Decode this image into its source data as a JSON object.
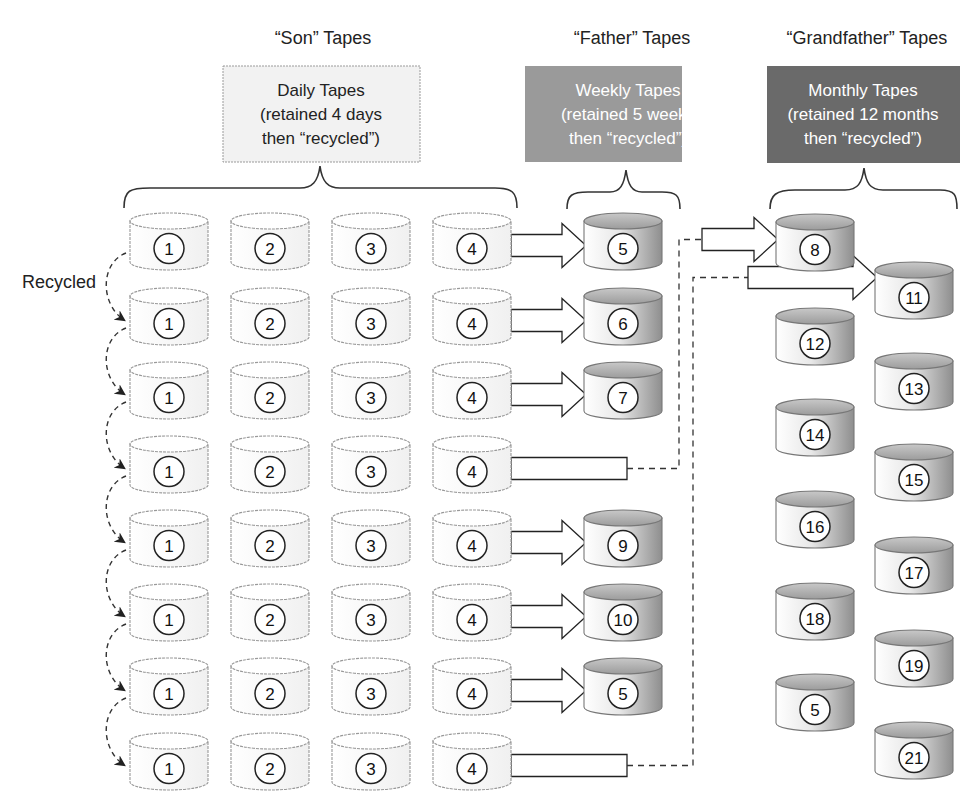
{
  "groups": [
    {
      "id": "son",
      "heading": "“Son” Tapes",
      "box_lines": [
        "Daily Tapes",
        "(retained 4 days",
        "then “recycled”)"
      ],
      "box_fill": "#f2f2f2",
      "text_color": "#222222"
    },
    {
      "id": "father",
      "heading": "“Father” Tapes",
      "box_lines": [
        "Weekly Tapes",
        "(retained 5 weeks",
        "then “recycled”)"
      ],
      "box_fill": "#9a9a9a",
      "text_color": "#ffffff"
    },
    {
      "id": "grandfather",
      "heading": "“Grandfather” Tapes",
      "box_lines": [
        "Monthly Tapes",
        "(retained 12 months",
        "then “recycled”)"
      ],
      "box_fill": "#6a6a6a",
      "text_color": "#ffffff"
    }
  ],
  "recycled_label": "Recycled",
  "daily_labels": [
    "1",
    "2",
    "3",
    "4"
  ],
  "weekly_rows": [
    {
      "row": 1,
      "type": "weekly",
      "label": "5"
    },
    {
      "row": 2,
      "type": "weekly",
      "label": "6"
    },
    {
      "row": 3,
      "type": "weekly",
      "label": "7"
    },
    {
      "row": 4,
      "type": "to-monthly",
      "target": "8"
    },
    {
      "row": 5,
      "type": "weekly",
      "label": "9"
    },
    {
      "row": 6,
      "type": "weekly",
      "label": "10"
    },
    {
      "row": 7,
      "type": "weekly",
      "label": "5"
    },
    {
      "row": 8,
      "type": "to-monthly",
      "target": "11"
    }
  ],
  "monthly_tapes": [
    "8",
    "11",
    "12",
    "13",
    "14",
    "15",
    "16",
    "17",
    "18",
    "19",
    "5",
    "21"
  ]
}
